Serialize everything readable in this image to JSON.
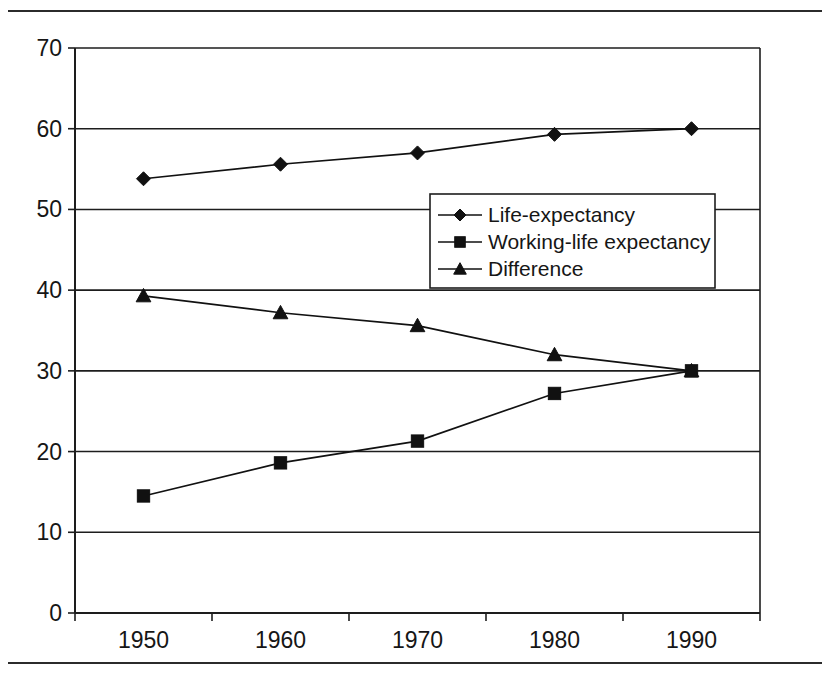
{
  "chart_data": {
    "type": "line",
    "title": "",
    "subtitle": "",
    "xlabel": "",
    "ylabel": "",
    "categories": [
      "1950",
      "1960",
      "1970",
      "1980",
      "1990"
    ],
    "x_tick_labels": [
      "1950",
      "1960",
      "1970",
      "1980",
      "1990"
    ],
    "y_tick_labels": [
      "0",
      "10",
      "20",
      "30",
      "40",
      "50",
      "60",
      "70"
    ],
    "y_ticks": [
      0,
      10,
      20,
      30,
      40,
      50,
      60,
      70
    ],
    "ylim": [
      0,
      70
    ],
    "grid": "horizontal",
    "legend_position": "center-right-upper",
    "series": [
      {
        "name": "Life-expectancy",
        "marker": "diamond",
        "values": [
          53.8,
          55.6,
          57.0,
          59.3,
          60.0
        ]
      },
      {
        "name": "Working-life expectancy",
        "marker": "square",
        "values": [
          14.5,
          18.6,
          21.3,
          27.2,
          30.0
        ]
      },
      {
        "name": "Difference",
        "marker": "triangle",
        "values": [
          39.3,
          37.2,
          35.6,
          32.0,
          30.0
        ]
      }
    ],
    "legend": [
      {
        "label": "Life-expectancy",
        "marker": "diamond"
      },
      {
        "label": "Working-life expectancy",
        "marker": "square"
      },
      {
        "label": "Difference",
        "marker": "triangle"
      }
    ],
    "colors": {
      "series_stroke": "#111111",
      "axis": "#1d1d1d",
      "background": "#ffffff",
      "text": "#161616"
    }
  }
}
